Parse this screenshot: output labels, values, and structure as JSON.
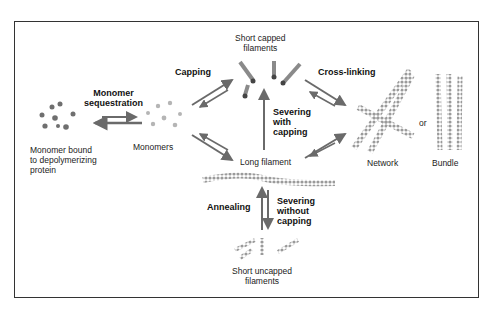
{
  "diagram": {
    "nodes": {
      "monomer_bound": "Monomer bound\nto depolymerizing\nprotein",
      "monomers": "Monomers",
      "short_capped": "Short capped\nfilaments",
      "long_filament": "Long filament",
      "short_uncapped": "Short uncapped\nfilaments",
      "network": "Network",
      "or": "or",
      "bundle": "Bundle"
    },
    "processes": {
      "monomer_sequestration": "Monomer\nsequestration",
      "capping": "Capping",
      "severing_with_capping": "Severing\nwith\ncapping",
      "cross_linking": "Cross-linking",
      "annealing": "Annealing",
      "severing_without_capping": "Severing\nwithout\ncapping"
    },
    "colors": {
      "arrow": "#6a6a6a",
      "filament": "#9a9a9a",
      "frame": "#333333"
    }
  }
}
